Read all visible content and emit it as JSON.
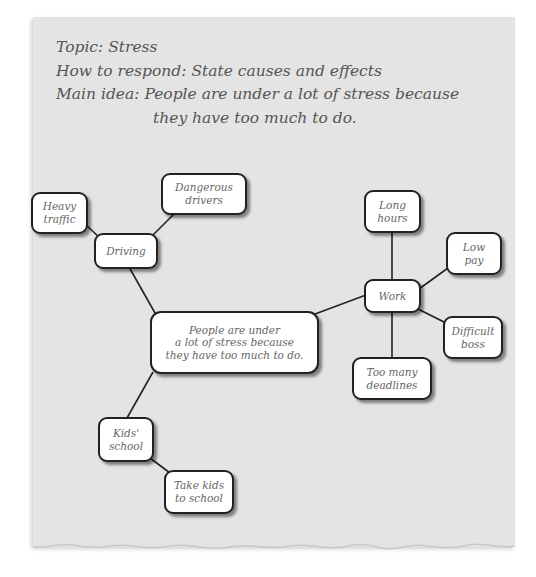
{
  "header": {
    "topic": "Topic: Stress",
    "how_to_respond": "How to respond: State causes and effects",
    "main_idea_line1": "Main idea: People are under a lot of stress because",
    "main_idea_line2": "they have too much to do."
  },
  "diagram": {
    "center": {
      "text": "People are under\na lot of stress because\nthey have too much to do."
    },
    "nodes": {
      "driving": {
        "text": "Driving"
      },
      "heavy_traffic": {
        "text": "Heavy\ntraffic"
      },
      "dangerous_drivers": {
        "text": "Dangerous\ndrivers"
      },
      "work": {
        "text": "Work"
      },
      "long_hours": {
        "text": "Long\nhours"
      },
      "low_pay": {
        "text": "Low\npay"
      },
      "difficult_boss": {
        "text": "Difficult\nboss"
      },
      "too_many_deadlines": {
        "text": "Too many\ndeadlines"
      },
      "kids_school": {
        "text": "Kids'\nschool"
      },
      "take_kids_to_school": {
        "text": "Take kids\nto school"
      }
    },
    "colors": {
      "paper": "#e4e4e4",
      "node_fill": "#ffffff",
      "node_border": "#222222",
      "text": "#555555",
      "line": "#222222"
    }
  }
}
